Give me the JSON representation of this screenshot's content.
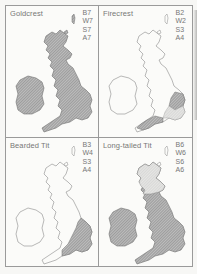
{
  "figure": {
    "panels": [
      {
        "title": "Goldcrest",
        "codes": [
          "B7",
          "W7",
          "S7",
          "A7"
        ],
        "distribution": "widespread"
      },
      {
        "title": "Firecrest",
        "codes": [
          "B2",
          "W2",
          "S3",
          "A4"
        ],
        "distribution": "south-east and south-west England"
      },
      {
        "title": "Bearded Tit",
        "codes": [
          "B3",
          "W4",
          "S3",
          "A4"
        ],
        "distribution": "east and south-east England"
      },
      {
        "title": "Long-tailed Tit",
        "codes": [
          "B6",
          "W6",
          "S6",
          "A6"
        ],
        "distribution": "widespread"
      }
    ],
    "colors": {
      "border": "#9a9a9a",
      "text": "#777777",
      "shading": "#9b9b9b",
      "light_shading": "#d6d6d6",
      "outline": "#8a8a8a"
    }
  }
}
